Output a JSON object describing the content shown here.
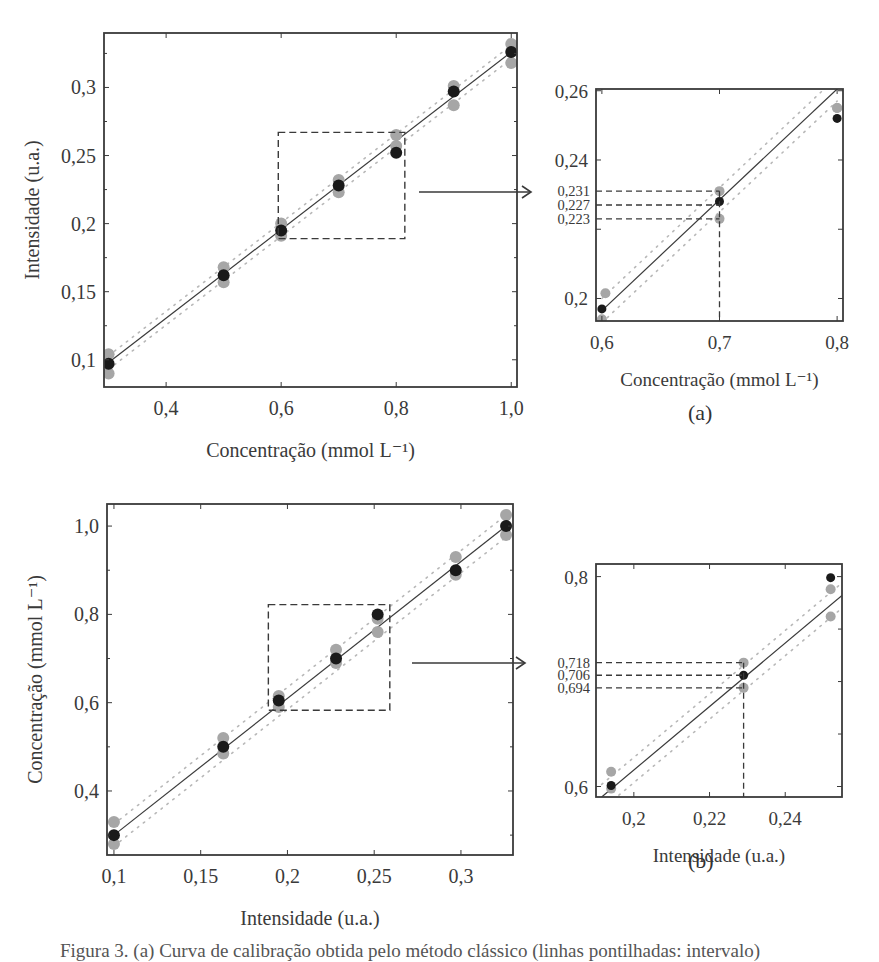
{
  "figure": {
    "panel_a_label": "(a)",
    "panel_b_label": "(b)",
    "caption": "Figura 3. (a) Curva de calibração obtida pelo método clássico (linhas pontilhadas: intervalo)"
  },
  "style": {
    "black_point": "#1a1a1a",
    "gray_point": "#a6a6a6",
    "fit_line": "#3a3a3a",
    "band_line": "#b8b8b8",
    "frame": "#3a3a3a",
    "dash": "#3a3a3a"
  },
  "chart_data": [
    {
      "id": "a-main",
      "type": "scatter",
      "title": "",
      "xlabel": "Concentração (mmol L⁻¹)",
      "ylabel": "Intensidade (u.a.)",
      "xlim": [
        0.292,
        1.01
      ],
      "ylim": [
        0.08,
        0.34
      ],
      "xticks": [
        0.4,
        0.6,
        0.8,
        1.0
      ],
      "xticklabels": [
        "0,4",
        "0,6",
        "0,8",
        "1,0"
      ],
      "yticks": [
        0.1,
        0.15,
        0.2,
        0.25,
        0.3
      ],
      "yticklabels": [
        "0,1",
        "0,15",
        "0,2",
        "0,25",
        "0,3"
      ],
      "grid": false,
      "frame_px": {
        "left": 104,
        "top": 33,
        "right": 517,
        "bottom": 387
      },
      "series": [
        {
          "name": "média",
          "color": "black",
          "x": [
            0.3,
            0.5,
            0.6,
            0.7,
            0.8,
            0.9,
            1.0
          ],
          "y": [
            0.097,
            0.162,
            0.195,
            0.228,
            0.252,
            0.297,
            0.326
          ]
        },
        {
          "name": "réplica superior",
          "color": "gray",
          "x": [
            0.3,
            0.5,
            0.6,
            0.7,
            0.8,
            0.9,
            1.0
          ],
          "y": [
            0.104,
            0.168,
            0.2,
            0.232,
            0.265,
            0.301,
            0.332
          ]
        },
        {
          "name": "réplica inferior",
          "color": "gray",
          "x": [
            0.3,
            0.5,
            0.6,
            0.7,
            0.8,
            0.9,
            1.0
          ],
          "y": [
            0.09,
            0.157,
            0.191,
            0.223,
            0.257,
            0.287,
            0.318
          ]
        }
      ],
      "fit": {
        "x": [
          0.3,
          1.0
        ],
        "y": [
          0.098,
          0.326
        ]
      },
      "band_upper": {
        "x": [
          0.3,
          1.0
        ],
        "y": [
          0.103,
          0.331
        ]
      },
      "band_lower": {
        "x": [
          0.3,
          1.0
        ],
        "y": [
          0.093,
          0.321
        ]
      },
      "zoom_box": {
        "x": [
          0.595,
          0.815
        ],
        "y": [
          0.189,
          0.267
        ]
      },
      "arrow": {
        "x1_px": 419,
        "x2_px": 531,
        "y_px": 192
      }
    },
    {
      "id": "a-inset",
      "type": "scatter",
      "title": "",
      "xlabel": "Concentração (mmol L⁻¹)",
      "ylabel": "",
      "xlim": [
        0.595,
        0.805
      ],
      "ylim": [
        0.1935,
        0.2605
      ],
      "xticks": [
        0.6,
        0.7,
        0.8
      ],
      "xticklabels": [
        "0,6",
        "0,7",
        "0,8"
      ],
      "yticks": [
        0.2,
        0.24,
        0.26
      ],
      "yticklabels": [
        "0,2",
        "0,24",
        "0,26"
      ],
      "grid": false,
      "frame_px": {
        "left": 596,
        "top": 89,
        "right": 843,
        "bottom": 321
      },
      "series": [
        {
          "name": "média",
          "color": "black",
          "x": [
            0.6,
            0.7,
            0.8
          ],
          "y": [
            0.197,
            0.228,
            0.252
          ]
        },
        {
          "name": "réplica superior",
          "color": "gray",
          "x": [
            0.603,
            0.7,
            0.8
          ],
          "y": [
            0.2015,
            0.231,
            0.255
          ]
        },
        {
          "name": "réplica inferior",
          "color": "gray",
          "x": [
            0.6,
            0.7,
            0.8
          ],
          "y": [
            0.194,
            0.223,
            0.255
          ]
        }
      ],
      "fit": {
        "x": [
          0.6,
          0.8
        ],
        "y": [
          0.1965,
          0.2605
        ]
      },
      "band_upper": {
        "x": [
          0.6,
          0.8
        ],
        "y": [
          0.2,
          0.264
        ]
      },
      "band_lower": {
        "x": [
          0.6,
          0.8
        ],
        "y": [
          0.193,
          0.257
        ]
      },
      "annotations": {
        "x_value": 0.7,
        "y_values": [
          0.231,
          0.227,
          0.223
        ],
        "y_labels": [
          "0,231",
          "0,227",
          "0,223"
        ]
      }
    },
    {
      "id": "b-main",
      "type": "scatter",
      "title": "",
      "xlabel": "Intensidade (u.a.)",
      "ylabel": "Concentração (mmol L⁻¹)",
      "xlim": [
        0.096,
        0.33
      ],
      "ylim": [
        0.255,
        1.05
      ],
      "xticks": [
        0.1,
        0.15,
        0.2,
        0.25,
        0.3
      ],
      "xticklabels": [
        "0,1",
        "0,15",
        "0,2",
        "0,25",
        "0,3"
      ],
      "yticks": [
        0.4,
        0.6,
        0.8,
        1.0
      ],
      "yticklabels": [
        "0,4",
        "0,6",
        "0,8",
        "1,0"
      ],
      "grid": false,
      "frame_px": {
        "left": 107,
        "top": 504,
        "right": 513,
        "bottom": 855
      },
      "series": [
        {
          "name": "média",
          "color": "black",
          "x": [
            0.1,
            0.163,
            0.195,
            0.228,
            0.252,
            0.297,
            0.326
          ],
          "y": [
            0.3,
            0.5,
            0.605,
            0.7,
            0.8,
            0.9,
            1.0
          ]
        },
        {
          "name": "réplica superior",
          "color": "gray",
          "x": [
            0.1,
            0.163,
            0.195,
            0.228,
            0.252,
            0.297,
            0.326
          ],
          "y": [
            0.33,
            0.52,
            0.615,
            0.72,
            0.79,
            0.93,
            1.025
          ]
        },
        {
          "name": "réplica inferior",
          "color": "gray",
          "x": [
            0.1,
            0.163,
            0.195,
            0.228,
            0.252,
            0.297,
            0.326
          ],
          "y": [
            0.28,
            0.485,
            0.59,
            0.69,
            0.76,
            0.89,
            0.98
          ]
        }
      ],
      "fit": {
        "x": [
          0.1,
          0.326
        ],
        "y": [
          0.3,
          1.0
        ]
      },
      "band_upper": {
        "x": [
          0.1,
          0.326
        ],
        "y": [
          0.325,
          1.025
        ]
      },
      "band_lower": {
        "x": [
          0.1,
          0.326
        ],
        "y": [
          0.275,
          0.975
        ]
      },
      "zoom_box": {
        "x": [
          0.189,
          0.259
        ],
        "y": [
          0.583,
          0.822
        ]
      },
      "arrow": {
        "x1_px": 412,
        "x2_px": 525,
        "y_px": 663
      }
    },
    {
      "id": "b-inset",
      "type": "scatter",
      "title": "",
      "xlabel": "Intensidade (u.a.)",
      "ylabel": "",
      "xlim": [
        0.19,
        0.255
      ],
      "ylim": [
        0.59,
        0.812
      ],
      "xticks": [
        0.2,
        0.22,
        0.24
      ],
      "xticklabels": [
        "0,2",
        "0,22",
        "0,24"
      ],
      "yticks": [
        0.6,
        0.8
      ],
      "yticklabels": [
        "0,6",
        "0,8"
      ],
      "grid": false,
      "frame_px": {
        "left": 596,
        "top": 564,
        "right": 842,
        "bottom": 797
      },
      "series": [
        {
          "name": "média",
          "color": "black",
          "x": [
            0.194,
            0.229,
            0.252
          ],
          "y": [
            0.601,
            0.706,
            0.799
          ]
        },
        {
          "name": "réplica superior",
          "color": "gray",
          "x": [
            0.194,
            0.229,
            0.252
          ],
          "y": [
            0.614,
            0.718,
            0.788
          ]
        },
        {
          "name": "réplica inferior",
          "color": "gray",
          "x": [
            0.194,
            0.229,
            0.252
          ],
          "y": [
            0.598,
            0.694,
            0.762
          ]
        }
      ],
      "fit": {
        "x": [
          0.1915,
          0.255
        ],
        "y": [
          0.59,
          0.782
        ]
      },
      "band_upper": {
        "x": [
          0.1915,
          0.255
        ],
        "y": [
          0.602,
          0.794
        ]
      },
      "band_lower": {
        "x": [
          0.1915,
          0.255
        ],
        "y": [
          0.578,
          0.77
        ]
      },
      "annotations": {
        "x_value": 0.229,
        "y_values": [
          0.718,
          0.706,
          0.694
        ],
        "y_labels": [
          "0,718",
          "0,706",
          "0,694"
        ]
      }
    }
  ]
}
